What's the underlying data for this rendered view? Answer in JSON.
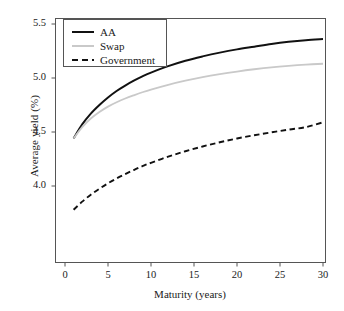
{
  "chart_data": {
    "type": "line",
    "title": "",
    "xlabel": "Maturity (years)",
    "ylabel": "Average yield (%)",
    "xlim": [
      0,
      30.8
    ],
    "ylim": [
      3.68,
      5.6
    ],
    "xticks": [
      0,
      5,
      10,
      15,
      20,
      25,
      30
    ],
    "xtick_labels": [
      "0",
      "5",
      "10",
      "15",
      "20",
      "25",
      "30"
    ],
    "yticks": [
      4.0,
      4.5,
      5.0,
      5.5
    ],
    "ytick_labels": [
      "4.0",
      "4.5",
      "5.0",
      "5.5"
    ],
    "grid": false,
    "legend_position": "upper left",
    "x": [
      1,
      2,
      3,
      4,
      5,
      6,
      7,
      8,
      9,
      10,
      12,
      14,
      16,
      18,
      20,
      22,
      24,
      26,
      28,
      30
    ],
    "series": [
      {
        "name": "AA",
        "style": "solid",
        "color": "#111111",
        "values": [
          4.44,
          4.57,
          4.67,
          4.75,
          4.82,
          4.88,
          4.93,
          4.975,
          5.015,
          5.05,
          5.11,
          5.16,
          5.2,
          5.235,
          5.265,
          5.29,
          5.315,
          5.335,
          5.35,
          5.36
        ]
      },
      {
        "name": "Swap",
        "style": "solid",
        "color": "#c9c9c9",
        "values": [
          4.44,
          4.545,
          4.625,
          4.685,
          4.735,
          4.775,
          4.81,
          4.84,
          4.868,
          4.893,
          4.937,
          4.975,
          5.008,
          5.036,
          5.06,
          5.081,
          5.099,
          5.113,
          5.124,
          5.132
        ]
      },
      {
        "name": "Government",
        "style": "dashed",
        "color": "#111111",
        "values": [
          3.78,
          3.855,
          3.92,
          3.975,
          4.025,
          4.07,
          4.11,
          4.148,
          4.183,
          4.215,
          4.272,
          4.322,
          4.366,
          4.405,
          4.44,
          4.47,
          4.497,
          4.522,
          4.545,
          4.59
        ]
      }
    ]
  },
  "axes": {
    "xlabel": "Maturity (years)",
    "ylabel": "Average yield (%)"
  },
  "legend": {
    "items": [
      {
        "label": "AA"
      },
      {
        "label": "Swap"
      },
      {
        "label": "Government"
      }
    ]
  },
  "colors": {
    "aa": "#111111",
    "swap": "#c9c9c9",
    "government": "#111111",
    "frame": "#555555",
    "text": "#1a1a1a",
    "background": "#ffffff"
  }
}
